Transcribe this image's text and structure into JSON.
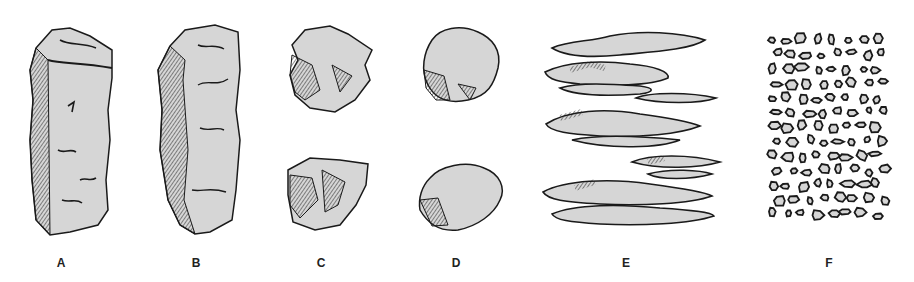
{
  "figure": {
    "background": "#ffffff",
    "fill": "#d6d6d6",
    "stroke": "#1a1a1a",
    "shade": "#3a3a3a",
    "panels": [
      {
        "id": "A",
        "label": "A",
        "x": 61
      },
      {
        "id": "B",
        "label": "B",
        "x": 196
      },
      {
        "id": "C",
        "label": "C",
        "x": 321
      },
      {
        "id": "D",
        "label": "D",
        "x": 456
      },
      {
        "id": "E",
        "label": "E",
        "x": 626
      },
      {
        "id": "F",
        "label": "F",
        "x": 829
      }
    ]
  }
}
